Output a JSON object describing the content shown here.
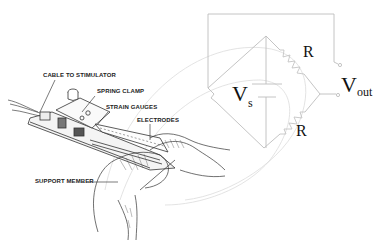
{
  "figure": {
    "callouts": [
      {
        "id": "cable",
        "label": "CABLE TO STIMULATOR"
      },
      {
        "id": "spring-clamp",
        "label": "SPRING CLAMP"
      },
      {
        "id": "strain-gauges",
        "label": "STRAIN GAUGES"
      },
      {
        "id": "electrodes",
        "label": "ELECTRODES"
      },
      {
        "id": "support-member",
        "label": "SUPPORT MEMBER"
      }
    ]
  },
  "circuit": {
    "supply_label": "V",
    "supply_subscript": "s",
    "resistor_top_label": "R",
    "resistor_bottom_label": "R",
    "output_label": "V",
    "output_subscript": "out",
    "line_color": "#bdbdbd",
    "resistor_color": "#c8c8c8"
  },
  "colors": {
    "background": "#ffffff",
    "ink": "#222222",
    "faint_line": "#d0d0d0"
  }
}
